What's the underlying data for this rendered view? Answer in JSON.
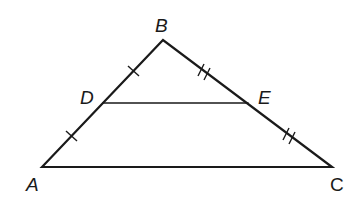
{
  "diagram": {
    "type": "triangle-midsegment",
    "stroke_color": "#1a1a1a",
    "vertices": {
      "A": {
        "label": "A",
        "x": 42,
        "y": 167,
        "lx": 26,
        "ly": 191
      },
      "B": {
        "label": "B",
        "x": 163,
        "y": 40,
        "lx": 155,
        "ly": 32
      },
      "C": {
        "label": "C",
        "x": 332,
        "y": 167,
        "lx": 330,
        "ly": 191
      },
      "D": {
        "label": "D",
        "x": 103,
        "y": 103,
        "lx": 80,
        "ly": 104
      },
      "E": {
        "label": "E",
        "x": 248,
        "y": 103,
        "lx": 258,
        "ly": 104
      }
    },
    "segments": [
      "AB",
      "BC",
      "CA",
      "DE"
    ],
    "tick_marks": {
      "AD": 1,
      "DB": 1,
      "BE": 2,
      "EC": 2
    }
  }
}
